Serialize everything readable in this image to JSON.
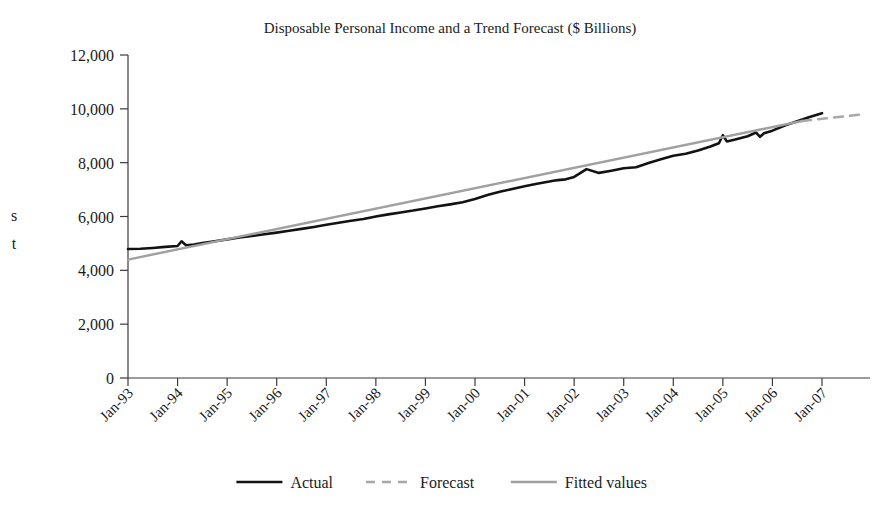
{
  "chart_data": {
    "type": "line",
    "title": "Disposable Personal Income and a Trend Forecast ($ Billions)",
    "xlabel": "",
    "ylabel_visible_fragment_1": "s",
    "ylabel_visible_fragment_2": "t",
    "ylim": [
      0,
      12000
    ],
    "ytick_values": [
      0,
      2000,
      4000,
      6000,
      8000,
      10000,
      12000
    ],
    "ytick_labels": [
      "0",
      "2,000",
      "4,000",
      "6,000",
      "8,000",
      "10,000",
      "12,000"
    ],
    "xtick_labels": [
      "Jan-93",
      "Jan-94",
      "Jan-95",
      "Jan-96",
      "Jan-97",
      "Jan-98",
      "Jan-99",
      "Jan-00",
      "Jan-01",
      "Jan-02",
      "Jan-03",
      "Jan-04",
      "Jan-05",
      "Jan-06",
      "Jan-07"
    ],
    "grid": false,
    "legend_position": "bottom-center",
    "colors": {
      "actual": "#121212",
      "forecast": "#a8a8a8",
      "fitted": "#a0a0a0",
      "axis": "#3a3a3a",
      "text": "#1b1b1b",
      "background": "#ffffff"
    },
    "legend": [
      {
        "name": "Actual",
        "style": "solid",
        "color": "#121212",
        "width": 2.6
      },
      {
        "name": "Forecast",
        "style": "dashed",
        "color": "#a8a8a8",
        "width": 2.4
      },
      {
        "name": "Fitted values",
        "style": "solid",
        "color": "#a0a0a0",
        "width": 2.4
      }
    ],
    "x_range_years": [
      1993.0,
      2007.0
    ],
    "series": [
      {
        "name": "Actual",
        "style": "solid",
        "color": "#121212",
        "x": [
          1993.0,
          1993.25,
          1993.5,
          1993.75,
          1994.0,
          1994.08,
          1994.17,
          1994.33,
          1994.5,
          1994.75,
          1995.0,
          1995.25,
          1995.5,
          1995.75,
          1996.0,
          1996.25,
          1996.5,
          1996.75,
          1997.0,
          1997.25,
          1997.5,
          1997.75,
          1998.0,
          1998.25,
          1998.5,
          1998.75,
          1999.0,
          1999.25,
          1999.5,
          1999.75,
          2000.0,
          2000.25,
          2000.5,
          2000.75,
          2001.0,
          2001.25,
          2001.5,
          2001.58,
          2001.67,
          2001.83,
          2002.0,
          2002.25,
          2002.5,
          2002.75,
          2003.0,
          2003.25,
          2003.5,
          2003.75,
          2004.0,
          2004.25,
          2004.5,
          2004.75,
          2004.92,
          2005.0,
          2005.08,
          2005.25,
          2005.5,
          2005.67,
          2005.75,
          2005.83,
          2006.0,
          2006.25,
          2006.5,
          2006.75,
          2007.0
        ],
        "y": [
          4790,
          4800,
          4830,
          4870,
          4905,
          5080,
          4930,
          4960,
          5010,
          5080,
          5150,
          5220,
          5280,
          5340,
          5400,
          5470,
          5540,
          5610,
          5690,
          5770,
          5840,
          5910,
          6000,
          6080,
          6150,
          6220,
          6300,
          6380,
          6450,
          6530,
          6650,
          6800,
          6920,
          7020,
          7120,
          7220,
          7300,
          7330,
          7350,
          7380,
          7470,
          7760,
          7620,
          7700,
          7790,
          7830,
          7990,
          8130,
          8260,
          8330,
          8450,
          8600,
          8720,
          9020,
          8790,
          8860,
          8980,
          9120,
          8960,
          9090,
          9190,
          9380,
          9540,
          9700,
          9840
        ]
      },
      {
        "name": "Fitted values",
        "style": "solid",
        "color": "#a0a0a0",
        "x": [
          1993.0,
          2006.6
        ],
        "y": [
          4400,
          9550
        ]
      },
      {
        "name": "Forecast",
        "style": "dashed",
        "color": "#a8a8a8",
        "x": [
          2006.6,
          2007.8
        ],
        "y": [
          9550,
          9790
        ]
      }
    ],
    "annotations": [
      {
        "text": "spike up near Jan-94",
        "x": 1994.08,
        "y": 5080
      },
      {
        "text": "bump near Jan-02",
        "x": 2002.25,
        "y": 7760
      },
      {
        "text": "spike up near Jan-05",
        "x": 2005.0,
        "y": 9020
      },
      {
        "text": "dip near mid-2005",
        "x": 2005.75,
        "y": 8960
      }
    ]
  }
}
